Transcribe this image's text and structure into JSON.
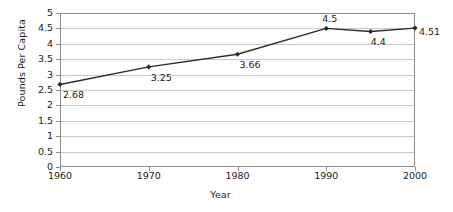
{
  "chart_data": {
    "type": "line",
    "title": "",
    "xlabel": "Year",
    "ylabel": "Pounds Per Capita",
    "x": [
      1960,
      1970,
      1980,
      1990,
      1995,
      2000
    ],
    "values": [
      2.68,
      3.25,
      3.66,
      4.5,
      4.4,
      4.51
    ],
    "point_labels": [
      "2.68",
      "3.25",
      "3.66",
      "4.5",
      "4.4",
      "4.51"
    ],
    "xticks": [
      "1960",
      "1970",
      "1980",
      "1990",
      "2000"
    ],
    "xtick_values": [
      1960,
      1970,
      1980,
      1990,
      2000
    ],
    "yticks": [
      "0",
      "0.5",
      "1",
      "1.5",
      "2",
      "2.5",
      "3",
      "3.5",
      "4",
      "4.5",
      "5"
    ],
    "ytick_values": [
      0,
      0.5,
      1,
      1.5,
      2,
      2.5,
      3,
      3.5,
      4,
      4.5,
      5
    ],
    "xlim": [
      1960,
      2000
    ],
    "ylim": [
      0,
      5
    ],
    "grid": "horizontal",
    "legend": "none",
    "series_color": "#2b2b2b",
    "grid_color": "#c9c9c9",
    "axis_color": "#8d8d8d",
    "background": "#ffffff",
    "marker": "diamond"
  }
}
